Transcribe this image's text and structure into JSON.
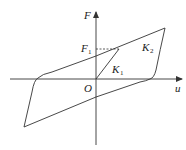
{
  "diagram": {
    "type": "hysteresis-loop",
    "axes": {
      "y_label": "F",
      "x_label": "u",
      "origin_label": "O"
    },
    "annotations": {
      "force_level": {
        "main": "F",
        "sub": "1"
      },
      "initial_stiffness": {
        "main": "K",
        "sub": "1"
      },
      "post_yield_stiffness": {
        "main": "K",
        "sub": "2"
      }
    },
    "colors": {
      "line": "#333333",
      "background": "#ffffff"
    }
  }
}
